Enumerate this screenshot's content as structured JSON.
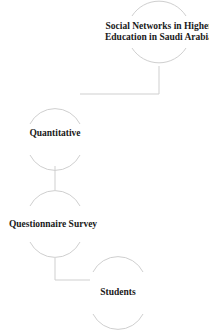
{
  "diagram": {
    "nodes": [
      {
        "id": "topic",
        "label_line1": "Social Networks in Higher",
        "label_line2": "Education in Saudi Arabia"
      },
      {
        "id": "approach",
        "label": "Quantitative"
      },
      {
        "id": "method",
        "label": "Questionnaire Survey"
      },
      {
        "id": "sample",
        "label": "Students"
      }
    ],
    "edges": [
      {
        "from": "topic",
        "to": "approach"
      },
      {
        "from": "approach",
        "to": "method"
      },
      {
        "from": "method",
        "to": "sample"
      }
    ],
    "colors": {
      "stroke": "#cfcfcf",
      "text": "#1a1a1a",
      "background": "#ffffff"
    }
  }
}
